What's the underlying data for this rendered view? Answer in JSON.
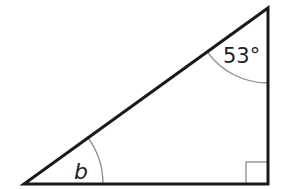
{
  "diagram": {
    "type": "right-triangle",
    "labels": {
      "top_angle": "53°",
      "bottom_left_angle": "b"
    },
    "vertices": {
      "bottom_left": [
        24,
        184
      ],
      "bottom_right": [
        268,
        184
      ],
      "top": [
        268,
        8
      ]
    },
    "colors": {
      "stroke": "#1a1a1a",
      "arc": "#8a8a8a",
      "right_angle_marker": "#8a8a8a",
      "background": "#ffffff"
    },
    "right_angle_at": "bottom_right"
  }
}
